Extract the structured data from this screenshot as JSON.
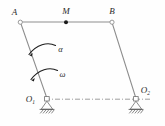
{
  "figure": {
    "background_color": "#fefefe",
    "line_color": "#8d8d8d",
    "label_color": "#2b2b2b",
    "arrow_color": "#1f1f1f"
  },
  "labels": {
    "point_a": "A",
    "point_m": "M",
    "point_b": "B",
    "pivot_o1": "O",
    "pivot_o1_sub": "1",
    "pivot_o2": "O",
    "pivot_o2_sub": "2",
    "angular_acceleration": "α",
    "angular_velocity": "ω"
  },
  "geometry": {
    "point_a": {
      "x": 20,
      "y": 22
    },
    "point_m": {
      "x": 66,
      "y": 22
    },
    "point_b": {
      "x": 112,
      "y": 22
    },
    "pivot_o1": {
      "x": 47,
      "y": 99
    },
    "pivot_o2": {
      "x": 136,
      "y": 99
    },
    "members": [
      {
        "name": "crank-O1A",
        "from": "pivot_o1",
        "to": "point_a"
      },
      {
        "name": "coupler-AB",
        "from": "point_a",
        "to": "point_b"
      },
      {
        "name": "link-BO2",
        "from": "point_b",
        "to": "pivot_o2"
      }
    ],
    "datum_line": {
      "name": "O1-O2-datum",
      "x1": 45,
      "y1": 99,
      "x2": 150,
      "y2": 99,
      "style": "dash-dot"
    }
  },
  "annotations": {
    "alpha_arc": {
      "label": "α",
      "label_x": 60,
      "label_y": 51,
      "direction": "counterclockwise"
    },
    "omega_arc": {
      "label": "ω",
      "label_x": 62,
      "label_y": 76,
      "direction": "counterclockwise"
    }
  },
  "supports": [
    {
      "name": "pin-support-O1",
      "type": "pinned",
      "x": 47,
      "y": 99,
      "hatched": true
    },
    {
      "name": "pin-support-O2",
      "type": "pinned",
      "x": 136,
      "y": 99,
      "hatched": true
    }
  ]
}
